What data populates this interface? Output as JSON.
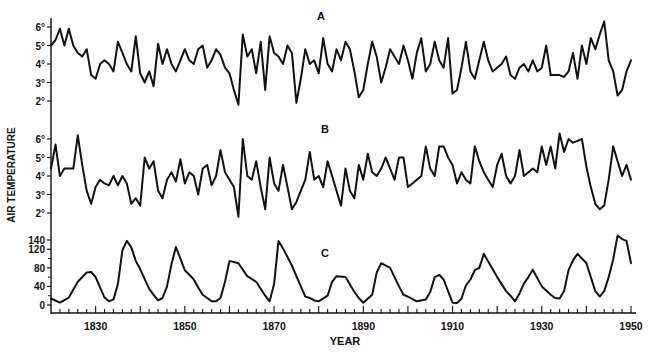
{
  "chart_data": {
    "type": "line",
    "title": "",
    "xlabel": "YEAR",
    "ylabel": "AIR TEMPERATURE",
    "xlim": [
      1820,
      1951
    ],
    "x_ticks": [
      1830,
      1850,
      1870,
      1890,
      1910,
      1930,
      1950
    ],
    "x_minor_step": 2,
    "grid": false,
    "legend": "none",
    "panels": [
      {
        "id": "A",
        "label": "A",
        "ylabel_ticks": [
          "2°",
          "3°",
          "4°",
          "5°",
          "6°"
        ],
        "ytick_values": [
          2,
          3,
          4,
          5,
          6
        ],
        "ylim": [
          1.5,
          6.5
        ],
        "x": [
          1820,
          1821,
          1822,
          1823,
          1824,
          1825,
          1826,
          1827,
          1828,
          1829,
          1830,
          1831,
          1832,
          1833,
          1834,
          1835,
          1836,
          1837,
          1838,
          1839,
          1840,
          1841,
          1842,
          1843,
          1844,
          1845,
          1846,
          1847,
          1848,
          1849,
          1850,
          1851,
          1852,
          1853,
          1854,
          1855,
          1856,
          1857,
          1858,
          1859,
          1860,
          1861,
          1862,
          1863,
          1864,
          1865,
          1866,
          1867,
          1868,
          1869,
          1870,
          1871,
          1872,
          1873,
          1874,
          1875,
          1876,
          1877,
          1878,
          1879,
          1880,
          1881,
          1882,
          1883,
          1884,
          1885,
          1886,
          1887,
          1888,
          1889,
          1890,
          1891,
          1892,
          1893,
          1894,
          1895,
          1896,
          1897,
          1898,
          1899,
          1900,
          1901,
          1902,
          1903,
          1904,
          1905,
          1906,
          1907,
          1908,
          1909,
          1910,
          1911,
          1912,
          1913,
          1914,
          1915,
          1916,
          1917,
          1918,
          1919,
          1920,
          1921,
          1922,
          1923,
          1924,
          1925,
          1926,
          1927,
          1928,
          1929,
          1930,
          1931,
          1932,
          1933,
          1934,
          1935,
          1936,
          1937,
          1938,
          1939,
          1940,
          1941,
          1942,
          1943,
          1944,
          1945,
          1946,
          1947,
          1948,
          1949,
          1950
        ],
        "values": [
          5.0,
          5.3,
          5.9,
          5.0,
          5.9,
          5.0,
          4.6,
          4.4,
          4.8,
          3.4,
          3.2,
          4.0,
          4.2,
          4.0,
          3.6,
          5.2,
          4.6,
          4.0,
          3.6,
          5.5,
          3.5,
          3.0,
          3.6,
          2.8,
          5.1,
          4.0,
          4.8,
          4.0,
          3.6,
          4.2,
          4.8,
          4.2,
          4.0,
          4.8,
          5.0,
          3.8,
          4.2,
          4.8,
          4.5,
          3.8,
          3.5,
          2.6,
          1.8,
          5.6,
          4.4,
          4.8,
          3.5,
          5.2,
          2.6,
          5.5,
          4.6,
          4.4,
          4.0,
          5.0,
          4.6,
          1.9,
          3.2,
          4.8,
          4.0,
          4.2,
          3.5,
          5.4,
          4.0,
          3.6,
          4.8,
          4.2,
          5.2,
          4.8,
          3.6,
          2.2,
          2.6,
          4.0,
          5.2,
          4.4,
          3.0,
          3.8,
          4.8,
          4.4,
          4.0,
          5.0,
          4.2,
          3.2,
          4.6,
          5.4,
          3.6,
          4.0,
          5.2,
          4.2,
          3.8,
          5.4,
          2.4,
          2.6,
          3.8,
          5.2,
          3.6,
          3.2,
          4.2,
          5.2,
          4.2,
          3.6,
          3.8,
          4.0,
          4.4,
          3.4,
          3.2,
          3.8,
          4.0,
          3.6,
          4.2,
          3.6,
          3.8,
          5.0,
          3.4,
          3.4,
          3.4,
          3.3,
          3.6,
          4.6,
          3.2,
          5.0,
          4.0,
          5.4,
          4.8,
          5.6,
          6.3,
          4.2,
          3.6,
          2.3,
          2.6,
          3.6,
          4.2,
          4.4,
          4.6,
          3.8,
          5.8,
          4.4
        ]
      },
      {
        "id": "B",
        "label": "B",
        "ylabel_ticks": [
          "2°",
          "3°",
          "4°",
          "5°",
          "6°"
        ],
        "ytick_values": [
          2,
          3,
          4,
          5,
          6
        ],
        "ylim": [
          1.5,
          6.5
        ],
        "x": [
          1820,
          1821,
          1822,
          1823,
          1824,
          1825,
          1826,
          1827,
          1828,
          1829,
          1830,
          1831,
          1832,
          1833,
          1834,
          1835,
          1836,
          1837,
          1838,
          1839,
          1840,
          1841,
          1842,
          1843,
          1844,
          1845,
          1846,
          1847,
          1848,
          1849,
          1850,
          1851,
          1852,
          1853,
          1854,
          1855,
          1856,
          1857,
          1858,
          1859,
          1860,
          1861,
          1862,
          1863,
          1864,
          1865,
          1866,
          1867,
          1868,
          1869,
          1870,
          1871,
          1872,
          1873,
          1874,
          1875,
          1876,
          1877,
          1878,
          1879,
          1880,
          1881,
          1882,
          1883,
          1884,
          1885,
          1886,
          1887,
          1888,
          1889,
          1890,
          1891,
          1892,
          1893,
          1894,
          1895,
          1896,
          1897,
          1898,
          1899,
          1900,
          1901,
          1902,
          1903,
          1904,
          1905,
          1906,
          1907,
          1908,
          1909,
          1910,
          1911,
          1912,
          1913,
          1914,
          1915,
          1916,
          1917,
          1918,
          1919,
          1920,
          1921,
          1922,
          1923,
          1924,
          1925,
          1926,
          1927,
          1928,
          1929,
          1930,
          1931,
          1932,
          1933,
          1934,
          1935,
          1936,
          1937,
          1938,
          1939,
          1940,
          1941,
          1942,
          1943,
          1944,
          1945,
          1946,
          1947,
          1948,
          1949,
          1950
        ],
        "values": [
          4.4,
          5.7,
          4.0,
          4.4,
          4.4,
          4.4,
          6.2,
          4.6,
          3.2,
          2.5,
          3.4,
          3.8,
          3.6,
          3.5,
          4.0,
          3.5,
          4.0,
          3.6,
          2.5,
          2.8,
          2.4,
          5.0,
          4.4,
          4.8,
          3.2,
          2.8,
          3.8,
          4.2,
          3.7,
          4.9,
          3.6,
          4.2,
          4.0,
          3.0,
          4.4,
          4.6,
          3.5,
          4.0,
          5.4,
          4.2,
          3.8,
          3.4,
          1.8,
          6.0,
          4.0,
          3.8,
          4.8,
          3.4,
          2.2,
          5.0,
          3.6,
          3.2,
          4.6,
          3.4,
          2.2,
          2.6,
          3.2,
          3.8,
          5.3,
          3.8,
          4.0,
          3.4,
          4.8,
          4.0,
          3.2,
          2.4,
          4.4,
          3.2,
          2.8,
          4.6,
          3.8,
          5.2,
          4.2,
          4.0,
          4.4,
          5.0,
          4.4,
          3.8,
          5.0,
          5.0,
          3.4,
          3.6,
          3.8,
          4.0,
          5.6,
          4.4,
          4.0,
          5.6,
          5.6,
          5.0,
          4.6,
          3.6,
          4.2,
          3.8,
          3.6,
          5.6,
          4.8,
          4.2,
          3.8,
          3.4,
          4.6,
          5.2,
          4.0,
          3.6,
          4.0,
          5.4,
          4.0,
          4.2,
          4.4,
          4.2,
          5.6,
          4.6,
          5.6,
          4.4,
          6.3,
          5.3,
          6.0,
          5.8,
          5.9,
          6.0,
          4.5,
          3.4,
          2.5,
          2.2,
          2.4,
          3.8,
          5.6,
          4.8,
          4.0,
          4.6,
          3.8,
          5.4,
          6.3,
          4.8,
          5.0
        ],
        "note": "values approximated from pixel positions"
      },
      {
        "id": "C",
        "label": "C",
        "ylabel_ticks": [
          "0",
          "40",
          "80",
          "120",
          "140"
        ],
        "ytick_values": [
          0,
          40,
          80,
          120,
          140
        ],
        "ylim": [
          -10,
          150
        ],
        "x": [
          1820,
          1822,
          1824,
          1826,
          1828,
          1829,
          1830,
          1832,
          1833,
          1834,
          1835,
          1836,
          1837,
          1838,
          1839,
          1840,
          1842,
          1843,
          1844,
          1845,
          1846,
          1847,
          1848,
          1849,
          1850,
          1851,
          1852,
          1853,
          1854,
          1856,
          1857,
          1858,
          1859,
          1860,
          1862,
          1864,
          1866,
          1867,
          1868,
          1869,
          1870,
          1871,
          1872,
          1874,
          1876,
          1877,
          1878,
          1879,
          1880,
          1882,
          1883,
          1884,
          1886,
          1888,
          1889,
          1890,
          1892,
          1893,
          1894,
          1896,
          1898,
          1899,
          1900,
          1902,
          1904,
          1905,
          1906,
          1907,
          1908,
          1910,
          1911,
          1912,
          1913,
          1914,
          1915,
          1916,
          1917,
          1918,
          1920,
          1922,
          1923,
          1924,
          1925,
          1926,
          1927,
          1928,
          1930,
          1932,
          1933,
          1934,
          1935,
          1936,
          1937,
          1938,
          1940,
          1942,
          1943,
          1944,
          1945,
          1946,
          1947,
          1948,
          1949,
          1950
        ],
        "values": [
          14,
          5,
          16,
          50,
          70,
          71,
          60,
          16,
          8,
          12,
          45,
          118,
          138,
          124,
          95,
          77,
          35,
          22,
          10,
          15,
          40,
          88,
          125,
          100,
          75,
          65,
          55,
          38,
          22,
          8,
          8,
          15,
          50,
          95,
          90,
          62,
          50,
          35,
          20,
          8,
          45,
          138,
          122,
          85,
          40,
          18,
          15,
          10,
          8,
          20,
          50,
          62,
          60,
          28,
          15,
          5,
          22,
          70,
          90,
          80,
          40,
          22,
          18,
          8,
          12,
          28,
          60,
          65,
          55,
          5,
          4,
          14,
          42,
          55,
          75,
          80,
          110,
          94,
          60,
          30,
          20,
          8,
          25,
          46,
          60,
          76,
          40,
          22,
          15,
          14,
          30,
          75,
          96,
          110,
          90,
          30,
          18,
          30,
          60,
          98,
          150,
          142,
          138,
          90
        ]
      }
    ]
  },
  "labels": {
    "ylabel": "AIR TEMPERATURE",
    "xlabel": "YEAR",
    "panel_a": "A",
    "panel_b": "B",
    "panel_c": "C",
    "xticks": [
      "1830",
      "1850",
      "1870",
      "1890",
      "1910",
      "1930",
      "1950"
    ]
  }
}
